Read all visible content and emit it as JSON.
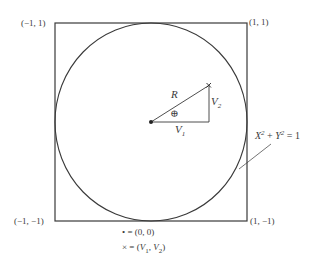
{
  "diagram": {
    "type": "unit-circle-in-square",
    "stroke_color": "#3a3a3a",
    "corners": {
      "top_left": "(−1, 1)",
      "top_right": "(1, 1)",
      "bottom_left": "(−1, −1)",
      "bottom_right": "(1, −1)"
    },
    "triangle": {
      "hypotenuse_label": "R",
      "vertical_label": "V",
      "vertical_sub": "2",
      "horizontal_label": "V",
      "horizontal_sub": "1",
      "angle_label": "⊕"
    },
    "circle_equation": {
      "x": "X",
      "x_exp": "2",
      "plus": " + ",
      "y": "Y",
      "y_exp": "2",
      "rest": " = 1"
    },
    "legend": {
      "dot_symbol": "•",
      "dot_text": " = (0, 0)",
      "cross_symbol": "×",
      "cross_text_pre": " = (",
      "v": "V",
      "sub1": "1",
      "comma": ", ",
      "sub2": "2",
      "cross_text_post": ")"
    }
  }
}
